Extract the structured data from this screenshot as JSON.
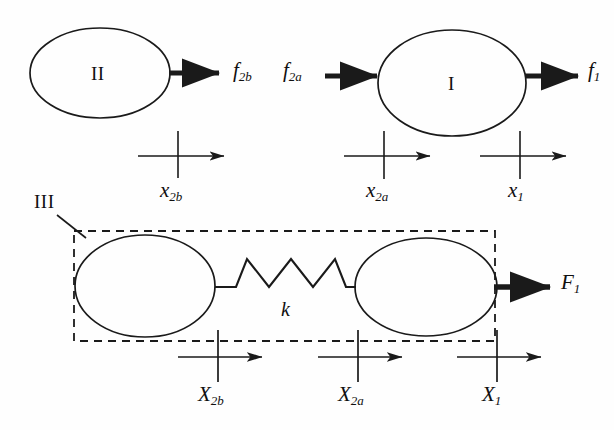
{
  "figure": {
    "stroke_color": "#1a1a1a",
    "background_color": "#fefefe"
  },
  "top_row": {
    "body_two": {
      "body_label": "II",
      "output_force_label": "f",
      "output_force_sub": "2b",
      "coordinate_label": "x",
      "coordinate_sub": "2b"
    },
    "body_one": {
      "body_label": "I",
      "input_force_label": "f",
      "input_force_sub": "2a",
      "output_force_label": "f",
      "output_force_sub": "1",
      "coordinate_left_label": "x",
      "coordinate_left_sub": "2a",
      "coordinate_right_label": "x",
      "coordinate_right_sub": "1"
    }
  },
  "bottom_row": {
    "system_label": "III",
    "spring_label": "k",
    "output_force_label": "F",
    "output_force_sub": "1",
    "coordinates": [
      {
        "label": "X",
        "sub": "2b"
      },
      {
        "label": "X",
        "sub": "2a"
      },
      {
        "label": "X",
        "sub": "1"
      }
    ]
  }
}
